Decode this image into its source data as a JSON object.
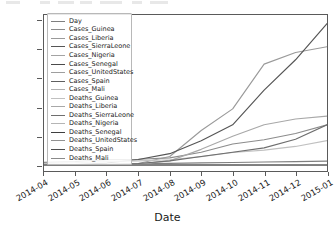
{
  "chart_data": {
    "type": "line",
    "title": "",
    "xlabel": "Date",
    "ylabel": "",
    "grid": false,
    "legend_position": "upper left",
    "ylim": [
      -400,
      10400
    ],
    "ytick_labels": [
      "0",
      "2000",
      "4000",
      "6000",
      "8000",
      "10000"
    ],
    "ytick_values": [
      0,
      2000,
      4000,
      6000,
      8000,
      10000
    ],
    "xtick_labels": [
      "2014-04",
      "2014-05",
      "2014-06",
      "2014-07",
      "2014-08",
      "2014-09",
      "2014-10",
      "2014-11",
      "2014-12",
      "2015-01"
    ],
    "x": [
      "2014-04",
      "2014-05",
      "2014-06",
      "2014-07",
      "2014-08",
      "2014-09",
      "2014-10",
      "2014-11",
      "2014-12",
      "2015-01"
    ],
    "series": [
      {
        "name": "Day",
        "color": "#7f7f7f",
        "values": [
          10,
          40,
          70,
          100,
          130,
          160,
          190,
          220,
          250,
          280
        ]
      },
      {
        "name": "Cases_Guinea",
        "color": "#8c8c8c",
        "values": [
          200,
          260,
          390,
          410,
          510,
          900,
          1470,
          1760,
          2200,
          2800
        ]
      },
      {
        "name": "Cases_Liberia",
        "color": "#9a9a9a",
        "values": [
          20,
          30,
          40,
          120,
          600,
          2400,
          3900,
          7000,
          7800,
          8200
        ]
      },
      {
        "name": "Cases_SierraLeone",
        "color": "#555555",
        "values": [
          0,
          50,
          150,
          400,
          800,
          1700,
          2800,
          5200,
          7300,
          9800
        ]
      },
      {
        "name": "Cases_Nigeria",
        "color": "#a3a3a3",
        "values": [
          0,
          0,
          0,
          10,
          16,
          20,
          20,
          20,
          20,
          20
        ]
      },
      {
        "name": "Cases_Senegal",
        "color": "#4a4a4a",
        "values": [
          0,
          0,
          0,
          0,
          1,
          1,
          1,
          1,
          1,
          1
        ]
      },
      {
        "name": "Cases_UnitedStates",
        "color": "#9e9e9e",
        "values": [
          0,
          0,
          0,
          0,
          0,
          0,
          1,
          4,
          4,
          4
        ]
      },
      {
        "name": "Cases_Spain",
        "color": "#5f5f5f",
        "values": [
          0,
          0,
          0,
          0,
          0,
          0,
          1,
          1,
          1,
          1
        ]
      },
      {
        "name": "Cases_Mali",
        "color": "#b0b0b0",
        "values": [
          0,
          0,
          0,
          0,
          0,
          0,
          0,
          7,
          8,
          8
        ]
      },
      {
        "name": "Deaths_Guinea",
        "color": "#c0c0c0",
        "values": [
          120,
          170,
          260,
          300,
          380,
          600,
          880,
          1050,
          1300,
          1700
        ]
      },
      {
        "name": "Deaths_Liberia",
        "color": "#a8a8a8",
        "values": [
          10,
          20,
          25,
          80,
          300,
          1100,
          2000,
          2800,
          3200,
          3400
        ]
      },
      {
        "name": "Deaths_SierraLeone",
        "color": "#6e6e6e",
        "values": [
          0,
          10,
          40,
          120,
          300,
          600,
          900,
          1200,
          1800,
          2800
        ]
      },
      {
        "name": "Deaths_Nigeria",
        "color": "#b5b5b5",
        "values": [
          0,
          0,
          0,
          2,
          6,
          8,
          8,
          8,
          8,
          8
        ]
      },
      {
        "name": "Deaths_Senegal",
        "color": "#3f3f3f",
        "values": [
          0,
          0,
          0,
          0,
          0,
          0,
          0,
          0,
          0,
          0
        ]
      },
      {
        "name": "Deaths_UnitedStates",
        "color": "#929292",
        "values": [
          0,
          0,
          0,
          0,
          0,
          0,
          0,
          1,
          1,
          1
        ]
      },
      {
        "name": "Deaths_Spain",
        "color": "#4f4f4f",
        "values": [
          0,
          0,
          0,
          0,
          0,
          0,
          0,
          0,
          0,
          0
        ]
      },
      {
        "name": "Deaths_Mali",
        "color": "#8a8a8a",
        "values": [
          0,
          0,
          0,
          0,
          0,
          0,
          0,
          6,
          6,
          6
        ]
      }
    ]
  }
}
